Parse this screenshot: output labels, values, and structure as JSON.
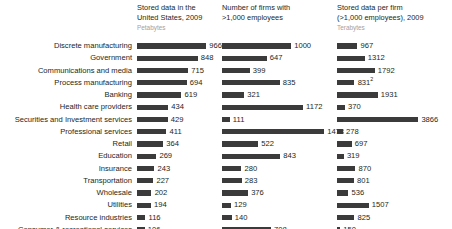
{
  "chart_data": {
    "type": "bar",
    "title": "",
    "xlabel": "",
    "ylabel": "",
    "grid": false,
    "legend": "none",
    "orientation": "horizontal",
    "layout": "three panel small-multiple, shared category axis, value labels at bar ends",
    "categories": [
      "Discrete manufacturing",
      "Government",
      "Communications and media",
      "Process manufacturing",
      "Banking",
      "Health care providers",
      "Securities and Investment services",
      "Professional services",
      "Retail",
      "Education",
      "Insurance",
      "Transportation",
      "Wholesale",
      "Utilities",
      "Resource industries",
      "Consumer & recreational services",
      "Construction"
    ],
    "panels": [
      {
        "title": "Stored data in the United States, 2009",
        "unit": "Petabytes",
        "values": [
          966,
          848,
          715,
          694,
          619,
          434,
          429,
          411,
          364,
          269,
          243,
          227,
          202,
          194,
          116,
          106,
          51
        ],
        "max": 966,
        "px_per_unit": 0.0715
      },
      {
        "title": "Number of firms with >1,000 employees",
        "unit": "",
        "values": [
          1000,
          647,
          399,
          835,
          321,
          1172,
          111,
          1478,
          522,
          843,
          280,
          283,
          376,
          129,
          140,
          708,
          222
        ],
        "max": 1478,
        "px_per_unit": 0.069
      },
      {
        "title": "Stored data per firm (>1,000 employees), 2009",
        "unit": "Terabytes",
        "values": [
          967,
          1312,
          1792,
          831,
          1931,
          370,
          3866,
          278,
          697,
          319,
          870,
          801,
          536,
          1507,
          825,
          150,
          231
        ],
        "footnotes": {
          "3": "2"
        },
        "max": 3866,
        "px_per_unit": 0.021
      }
    ]
  }
}
